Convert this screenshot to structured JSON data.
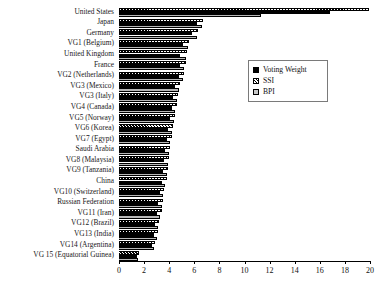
{
  "chart_data": {
    "type": "bar",
    "orientation": "horizontal",
    "title": "",
    "xlabel": "",
    "ylabel": "",
    "xlim": [
      0,
      20
    ],
    "xticks": [
      0,
      2,
      4,
      6,
      8,
      10,
      12,
      14,
      16,
      18,
      20
    ],
    "grid": false,
    "legend_position": "upper-right",
    "categories": [
      "United States",
      "Japan",
      "Germany",
      "VG1 (Belgium)",
      "United Kingdom",
      "France",
      "VG2 (Netherlands)",
      "VG3 (Mexico)",
      "VG3 (Italy)",
      "VG4 (Canada)",
      "VG5 (Norway)",
      "VG6 (Korea)",
      "VG7 (Egypt)",
      "Saudi Arabia",
      "VG8 (Malaysia)",
      "VG9 (Tanzania)",
      "China",
      "VG10 (Switzerland)",
      "Russian Federation",
      "VG11 (Iran)",
      "VG12 (Brazil)",
      "VG13 (India)",
      "VG14 (Argentina)",
      "VG 15 (Equatorial Guinea)"
    ],
    "series": [
      {
        "name": "Voting Weight",
        "color": "#000000",
        "pattern": "solid",
        "values": [
          16.8,
          6.2,
          5.8,
          5.1,
          4.9,
          4.9,
          4.8,
          4.5,
          4.3,
          4.2,
          4.1,
          3.9,
          3.8,
          3.7,
          3.6,
          3.5,
          3.4,
          3.3,
          3.1,
          3.0,
          2.9,
          2.8,
          2.6,
          1.4
        ]
      },
      {
        "name": "SSI",
        "color": "#8a8a8a",
        "pattern": "diagonal-hatch",
        "values": [
          19.9,
          6.7,
          6.3,
          5.6,
          5.4,
          5.3,
          5.2,
          4.9,
          4.7,
          4.6,
          4.5,
          4.3,
          4.2,
          4.1,
          4.0,
          3.9,
          3.8,
          3.6,
          3.5,
          3.4,
          3.2,
          3.1,
          2.9,
          1.6
        ]
      },
      {
        "name": "BPI",
        "color": "#b8b8b8",
        "pattern": "solid-light",
        "values": [
          11.3,
          6.6,
          6.2,
          5.5,
          5.3,
          5.2,
          5.1,
          4.8,
          4.6,
          4.5,
          4.4,
          4.2,
          4.1,
          4.0,
          3.9,
          3.8,
          3.7,
          3.5,
          3.4,
          3.3,
          3.1,
          3.0,
          2.8,
          1.5
        ]
      }
    ]
  },
  "legend": {
    "entries": [
      {
        "label": "Voting Weight",
        "icon": "filled-square-icon"
      },
      {
        "label": "SSI",
        "icon": "hatched-square-icon"
      },
      {
        "label": "BPI",
        "icon": "light-square-icon"
      }
    ]
  }
}
